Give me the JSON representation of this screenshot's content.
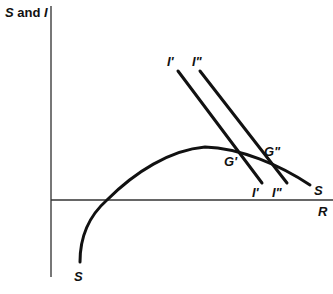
{
  "title": {
    "prefix": "S",
    "middle": " and ",
    "suffix": "I"
  },
  "axes": {
    "x_label": "R",
    "y_label": "S and I"
  },
  "curves": {
    "saving": {
      "label_top": "S",
      "label_bottom": "S",
      "color": "#111111"
    },
    "investment_1": {
      "label_top": "I'",
      "label_bottom": "I'",
      "color": "#111111"
    },
    "investment_2": {
      "label_top": "I\"",
      "label_bottom": "I\"",
      "color": "#111111"
    }
  },
  "points": {
    "g1": "G'",
    "g2": "G\""
  },
  "colors": {
    "axis": "#555555",
    "curve": "#111111",
    "background": "#ffffff"
  }
}
